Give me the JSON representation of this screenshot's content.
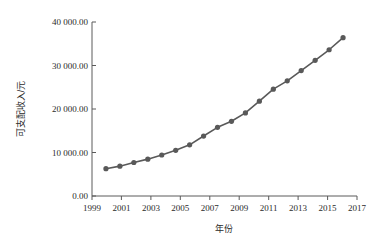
{
  "chart_data": {
    "type": "line",
    "title": "",
    "subtitle": "",
    "xlabel": "年份",
    "ylabel": "可支配收入/元",
    "x": [
      2000,
      2001,
      2002,
      2003,
      2004,
      2005,
      2006,
      2007,
      2008,
      2009,
      2010,
      2011,
      2012,
      2013,
      2014,
      2015,
      2016,
      2017
    ],
    "categories": [
      "2000",
      "2001",
      "2002",
      "2003",
      "2004",
      "2005",
      "2006",
      "2007",
      "2008",
      "2009",
      "2010",
      "2011",
      "2012",
      "2013",
      "2014",
      "2015",
      "2016",
      "2017"
    ],
    "values": [
      6280,
      6860,
      7703,
      8472,
      9422,
      10493,
      11759,
      13786,
      15781,
      17175,
      19109,
      21810,
      24565,
      26467,
      28844,
      31195,
      33616,
      36396
    ],
    "series": [
      {
        "name": "可支配收入",
        "values": [
          6280,
          6860,
          7703,
          8472,
          9422,
          10493,
          11759,
          13786,
          15781,
          17175,
          19109,
          21810,
          24565,
          26467,
          28844,
          31195,
          33616,
          36396
        ]
      }
    ],
    "xlim": [
      1999,
      2018
    ],
    "ylim": [
      0,
      40000
    ],
    "xticks": [
      1999,
      2001,
      2003,
      2005,
      2007,
      2009,
      2011,
      2013,
      2015,
      2017
    ],
    "xtick_labels": [
      "1999",
      "2001",
      "2003",
      "2005",
      "2007",
      "2009",
      "2011",
      "2013",
      "2015",
      "2017"
    ],
    "yticks": [
      0,
      10000,
      20000,
      30000,
      40000
    ],
    "ytick_labels": [
      "0.00",
      "10 000.00",
      "20 000.00",
      "30 000.00",
      "40 000.00"
    ],
    "grid": false,
    "legend": false,
    "legend_position": "none",
    "marker": "circle",
    "annotations": []
  },
  "style": {
    "series_color": "#595959",
    "axis_color": "#5a5a5a",
    "text_color": "#2b2b2b",
    "background": "#ffffff",
    "line_width": 1.6,
    "marker_radius": 2.6
  },
  "axes": {
    "y_tick_labels": [
      "40 000.00",
      "30 000.00",
      "20 000.00",
      "10 000.00",
      "0.00"
    ],
    "x_tick_labels": [
      "1999",
      "2001",
      "2003",
      "2005",
      "2007",
      "2009",
      "2011",
      "2013",
      "2015",
      "2017"
    ],
    "x_title": "年份",
    "y_title": "可支配收入/元"
  }
}
